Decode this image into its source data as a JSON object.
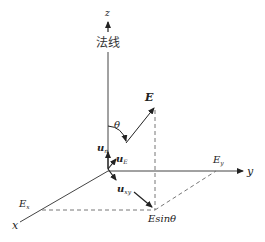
{
  "diagram": {
    "axes": {
      "z_label": "z",
      "y_label": "y",
      "x_label": "x",
      "normal_label": "法线"
    },
    "vectors": {
      "E_label": "E",
      "u_n": {
        "base": "u",
        "sub": "n"
      },
      "u_E": {
        "base": "u",
        "sub": "E"
      },
      "u_xy": {
        "base": "u",
        "sub": "xy"
      }
    },
    "angle_label": "θ",
    "components": {
      "Ex": {
        "base": "E",
        "sub": "x"
      },
      "Ey": {
        "base": "E",
        "sub": "y"
      },
      "Esin": "Esinθ"
    },
    "colors": {
      "line": "#333333",
      "dashed": "#777777"
    }
  }
}
